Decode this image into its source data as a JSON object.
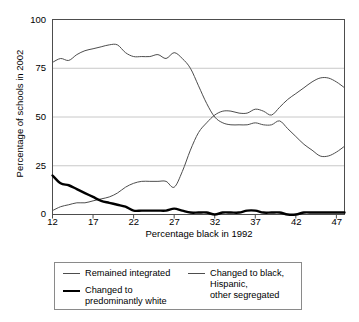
{
  "chart_data": {
    "type": "line",
    "title": "",
    "xlabel": "Percentage black in 1992",
    "ylabel": "Percentage of schools in 2002",
    "xlim": [
      12,
      48
    ],
    "ylim": [
      0,
      100
    ],
    "xticks": [
      12,
      17,
      22,
      27,
      32,
      37,
      42,
      47
    ],
    "yticks": [
      0,
      25,
      50,
      75,
      100
    ],
    "grid": "horizontal",
    "legend_position": "below",
    "series": [
      {
        "name": "Remained integrated",
        "color": "#4d4d4d",
        "width": 1,
        "x": [
          12,
          13,
          14,
          15,
          16,
          17,
          18,
          19,
          20,
          21,
          22,
          23,
          24,
          25,
          26,
          27,
          28,
          29,
          30,
          31,
          32,
          33,
          34,
          35,
          36,
          37,
          38,
          39,
          40,
          41,
          42,
          43,
          44,
          45,
          46,
          47,
          48
        ],
        "values": [
          78,
          80,
          79,
          82,
          84,
          85,
          86,
          87,
          87,
          83,
          81,
          81,
          81,
          82,
          80,
          83,
          80,
          75,
          66,
          57,
          50,
          47,
          46,
          46,
          46,
          47,
          46,
          46,
          48,
          44,
          40,
          36,
          33,
          30,
          30,
          32,
          35
        ]
      },
      {
        "name": "Changed to black, Hispanic, other segregated",
        "color": "#4d4d4d",
        "width": 1,
        "x": [
          12,
          13,
          14,
          15,
          16,
          17,
          18,
          19,
          20,
          21,
          22,
          23,
          24,
          25,
          26,
          27,
          28,
          29,
          30,
          31,
          32,
          33,
          34,
          35,
          36,
          37,
          38,
          39,
          40,
          41,
          42,
          43,
          44,
          45,
          46,
          47,
          48
        ],
        "values": [
          2,
          4,
          5,
          6,
          6,
          7,
          8,
          9,
          11,
          14,
          16,
          17,
          17,
          17,
          17,
          14,
          22,
          33,
          42,
          47,
          51,
          53,
          53,
          52,
          52,
          54,
          53,
          51,
          55,
          59,
          62,
          65,
          68,
          70,
          70,
          68,
          65
        ]
      },
      {
        "name": "Changed to predominantly white",
        "color": "#000000",
        "width": 2.4,
        "x": [
          12,
          13,
          14,
          15,
          16,
          17,
          18,
          19,
          20,
          21,
          22,
          23,
          24,
          25,
          26,
          27,
          28,
          29,
          30,
          31,
          32,
          33,
          34,
          35,
          36,
          37,
          38,
          39,
          40,
          41,
          42,
          43,
          44,
          45,
          46,
          47,
          48
        ],
        "values": [
          20,
          16,
          15,
          13,
          11,
          9,
          7,
          6,
          5,
          4,
          2,
          2,
          2,
          2,
          2,
          3,
          2,
          1,
          1,
          1,
          0,
          1,
          1,
          1,
          2,
          2,
          1,
          1,
          1,
          0,
          0,
          1,
          1,
          1,
          1,
          1,
          1
        ]
      }
    ]
  },
  "axes": {
    "y_label": "Percentage of schools in 2002",
    "x_label": "Percentage black in 1992",
    "y_ticks": [
      "100",
      "75",
      "50",
      "25",
      "0"
    ],
    "x_ticks": [
      "12",
      "17",
      "22",
      "27",
      "32",
      "37",
      "42",
      "47"
    ]
  },
  "legend": {
    "entries": [
      {
        "label": "Remained integrated",
        "style": "thin"
      },
      {
        "label": "Changed to\npredominantly white",
        "style": "thick"
      },
      {
        "label": "Changed to black, Hispanic,\nother segregated",
        "style": "thin"
      }
    ]
  },
  "colors": {
    "frame": "#4d4d4d",
    "gridline": "#c8c8c8",
    "thin_line": "#4d4d4d",
    "thick_line": "#000000",
    "background": "#ffffff"
  }
}
